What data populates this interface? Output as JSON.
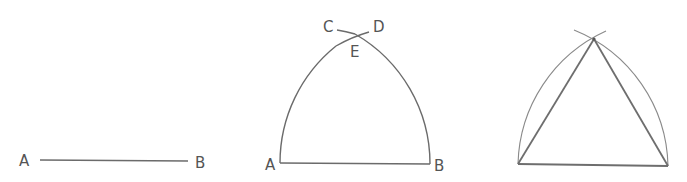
{
  "figure": {
    "panels": [
      {
        "step": 1,
        "labels": {
          "left": "A",
          "right": "B"
        },
        "elements": [
          "segment AB"
        ]
      },
      {
        "step": 2,
        "labels": {
          "left": "A",
          "right": "B",
          "arc_left_end": "C",
          "arc_right_end": "D",
          "intersection": "E"
        },
        "elements": [
          "segment AB",
          "arc centered at A through B (ending at D)",
          "arc centered at B through A (ending at C)",
          "intersection E"
        ]
      },
      {
        "step": 3,
        "labels": {},
        "elements": [
          "segment AB",
          "arc from A",
          "arc from B",
          "segment AE",
          "segment BE",
          "equilateral triangle ABE"
        ]
      }
    ]
  },
  "colors": {
    "line": "#6b6b6b",
    "label": "#555555",
    "background": "#ffffff"
  }
}
